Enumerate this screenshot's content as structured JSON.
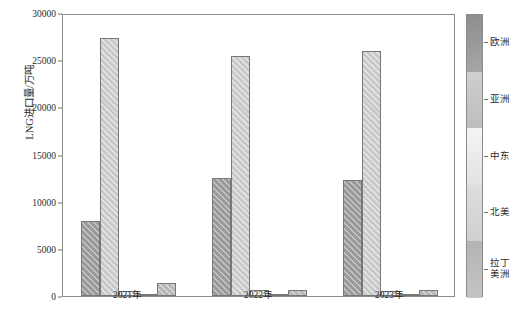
{
  "chart_data": {
    "type": "bar",
    "title": "",
    "xlabel": "",
    "ylabel": "LNG进口量/万吨",
    "categories": [
      "2021年",
      "2022年",
      "2023年"
    ],
    "ylim": [
      0,
      30000
    ],
    "yticks": [
      0,
      5000,
      10000,
      15000,
      20000,
      25000,
      30000
    ],
    "ytick_labels": [
      "0",
      "5000",
      "10000",
      "15000",
      "20000",
      "25000",
      "30000"
    ],
    "grid": false,
    "legend_position": "right",
    "legend_style": "vertical-colorbar",
    "series": [
      {
        "name": "欧洲",
        "values": [
          8000,
          12500,
          12350
        ]
      },
      {
        "name": "亚洲",
        "values": [
          27400,
          25400,
          26000
        ]
      },
      {
        "name": "中东",
        "values": [
          500,
          600,
          550
        ]
      },
      {
        "name": "北美",
        "values": [
          200,
          150,
          180
        ]
      },
      {
        "name": "拉丁美洲",
        "values": [
          1400,
          650,
          620
        ]
      }
    ]
  },
  "axis": {
    "y_title": "LNG进口量/万吨",
    "y_ticks": [
      "30000",
      "25000",
      "20000",
      "15000",
      "10000",
      "5000",
      "0"
    ],
    "x_ticks": [
      "2021年",
      "2022年",
      "2023年"
    ]
  },
  "legend": {
    "items": [
      {
        "label": "欧洲"
      },
      {
        "label": "亚洲"
      },
      {
        "label": "中东"
      },
      {
        "label": "北美"
      },
      {
        "label": "拉丁\n美洲"
      }
    ],
    "latin_america_line1": "拉丁",
    "latin_america_line2": "美洲"
  },
  "colors": {
    "europe": "#9a9a9a",
    "asia": "#c9c9c9",
    "middle_east": "#ededed",
    "north_america": "#dcdcdc",
    "latin_america": "#b7b7b7",
    "axis": "#8c8c8c",
    "text": "#2b2b2b"
  }
}
